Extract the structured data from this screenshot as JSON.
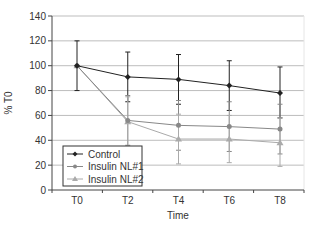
{
  "chart_data": {
    "type": "line",
    "title": "",
    "xlabel": "Time",
    "ylabel": "% T0",
    "categories": [
      "T0",
      "T2",
      "T4",
      "T6",
      "T8"
    ],
    "ylim": [
      0,
      140
    ],
    "yticks": [
      0,
      20,
      40,
      60,
      80,
      100,
      120,
      140
    ],
    "grid": true,
    "legend_position": "lower left",
    "series": [
      {
        "name": "Control",
        "marker": "diamond",
        "color": "#222222",
        "values": [
          100,
          91,
          89,
          84,
          78
        ],
        "error_low": [
          80,
          71,
          69,
          64,
          58
        ],
        "error_high": [
          120,
          111,
          109,
          104,
          99
        ]
      },
      {
        "name": "Insulin NL#1",
        "marker": "circle",
        "color": "#888888",
        "values": [
          100,
          56,
          52,
          51,
          49
        ],
        "error_low": [
          100,
          36,
          32,
          31,
          29
        ],
        "error_high": [
          100,
          76,
          72,
          71,
          69
        ]
      },
      {
        "name": "Insulin NL#2",
        "marker": "triangle",
        "color": "#aaaaaa",
        "values": [
          100,
          55,
          41,
          41,
          38
        ],
        "error_low": [
          100,
          35,
          21,
          22,
          19
        ],
        "error_high": [
          100,
          75,
          61,
          60,
          58
        ]
      }
    ]
  }
}
